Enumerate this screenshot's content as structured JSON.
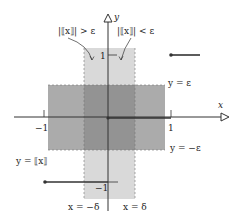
{
  "figure": {
    "axis_x_label": "x",
    "axis_y_label": "y",
    "ticks": {
      "x_neg1": "−1",
      "x_pos1": "1",
      "y_pos1": "1",
      "y_neg1": "−1"
    },
    "annotations": {
      "greater": "|⟦x⟧| > ε",
      "less": "|⟦x⟧| < ε",
      "y_eps": "y = ε",
      "y_neg_eps": "y = −ε",
      "func": "y = ⟦x⟧",
      "x_neg_delta": "x = −δ",
      "x_delta": "x = δ"
    },
    "colors": {
      "light_band": "#d9d9d9",
      "mid_band": "#a9a9a9",
      "overlap": "#8f8f8f",
      "axis": "#333333",
      "graph": "#333333"
    }
  }
}
